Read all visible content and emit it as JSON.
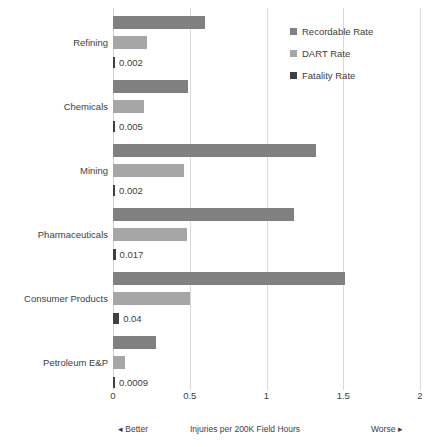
{
  "chart_data": {
    "type": "bar",
    "orientation": "horizontal",
    "title": "",
    "xlabel": "Injuries per 200K Field Hours",
    "ylabel": "",
    "xlim": [
      0,
      2
    ],
    "xticks": [
      "0",
      "0.5",
      "1",
      "1.5",
      "2"
    ],
    "xtick_values": [
      0,
      0.5,
      1,
      1.5,
      2
    ],
    "grid": true,
    "legend_position": "top-right",
    "categories": [
      "Refining",
      "Chemicals",
      "Mining",
      "Pharmaceuticals",
      "Consumer Products",
      "Petroleum E&P"
    ],
    "series": [
      {
        "name": "Recordable Rate",
        "color": "#808080",
        "values": [
          0.6,
          0.49,
          1.32,
          1.18,
          1.51,
          0.28
        ]
      },
      {
        "name": "DART Rate",
        "color": "#a6a6a6",
        "values": [
          0.22,
          0.2,
          0.46,
          0.48,
          0.5,
          0.08
        ]
      },
      {
        "name": "Fatality Rate",
        "color": "#404040",
        "values": [
          0.002,
          0.005,
          0.002,
          0.017,
          0.04,
          0.0009
        ],
        "labels": [
          "0.002",
          "0.005",
          "0.002",
          "0.017",
          "0.04",
          "0.0009"
        ]
      }
    ],
    "annotations": {
      "left_direction": "◂ Better",
      "right_direction": "Worse ▸"
    }
  },
  "legend": {
    "items": [
      {
        "label": "Recordable Rate",
        "color": "#808080"
      },
      {
        "label": "DART Rate",
        "color": "#a6a6a6"
      },
      {
        "label": "Fatality Rate",
        "color": "#404040"
      }
    ]
  }
}
